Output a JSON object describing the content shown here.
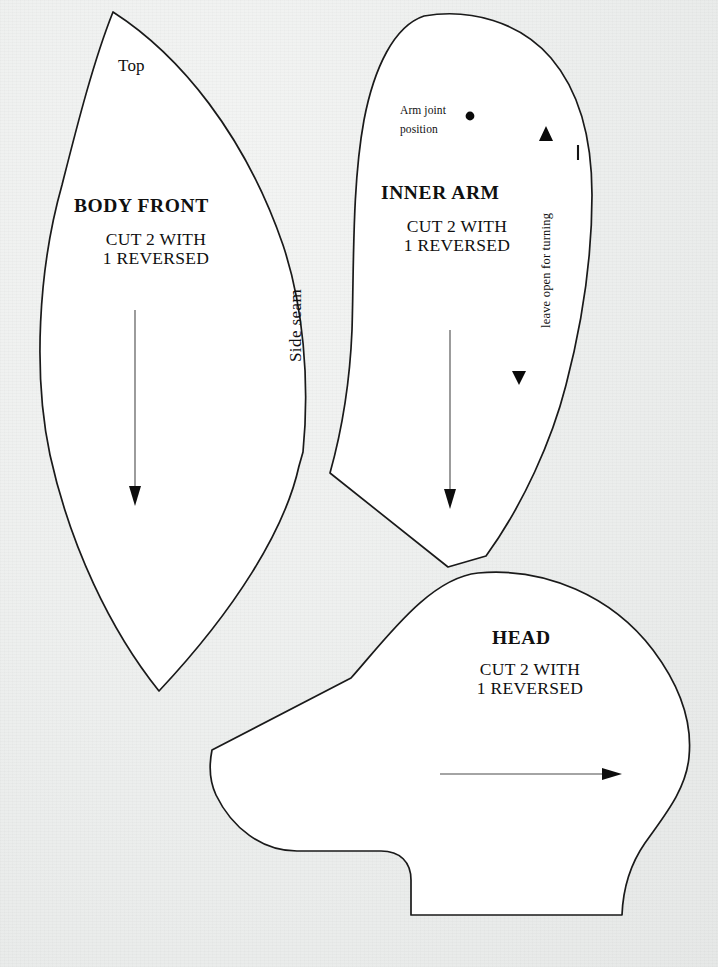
{
  "document": {
    "kind": "sewing-pattern-sheet",
    "background_color": "#eef0ef",
    "ink_color": "#111111",
    "piece_fill_color": "#ffffff"
  },
  "pieces": [
    {
      "id": "body-front",
      "title": "BODY FRONT",
      "cut_line_1": "CUT 2 WITH",
      "cut_line_2": "1 REVERSED",
      "labels": {
        "top": "Top",
        "side_seam": "Side seam"
      },
      "grain_arrow": {
        "direction": "down",
        "from": [
          135,
          310
        ],
        "to": [
          135,
          505
        ]
      }
    },
    {
      "id": "inner-arm",
      "title": "INNER ARM",
      "cut_line_1": "CUT 2 WITH",
      "cut_line_2": "1 REVERSED",
      "labels": {
        "arm_joint_line_1": "Arm joint",
        "arm_joint_line_2": "position",
        "leave_open": "leave open for turning"
      },
      "markers": {
        "arm_joint_dot": [
          470,
          116
        ],
        "notch_up": [
          546,
          134
        ],
        "notch_down": [
          519,
          378
        ],
        "edge_tick": [
          578,
          152
        ]
      },
      "grain_arrow": {
        "direction": "down",
        "from": [
          450,
          330
        ],
        "to": [
          450,
          508
        ]
      }
    },
    {
      "id": "head",
      "title": "HEAD",
      "cut_line_1": "CUT 2 WITH",
      "cut_line_2": "1 REVERSED",
      "grain_arrow": {
        "direction": "right",
        "from": [
          440,
          774
        ],
        "to": [
          622,
          774
        ]
      }
    }
  ]
}
